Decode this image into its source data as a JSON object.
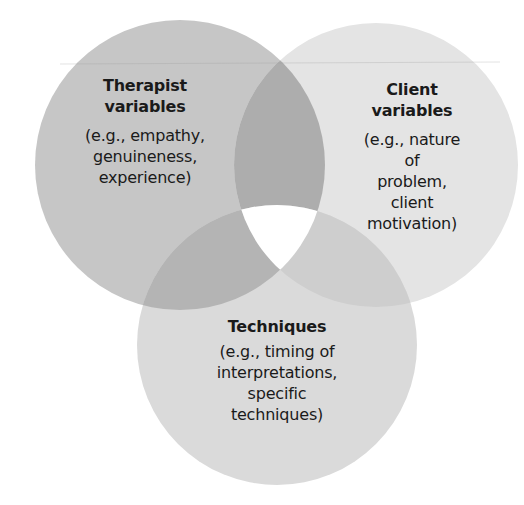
{
  "diagram": {
    "type": "venn",
    "background": "#ffffff",
    "sets": [
      {
        "id": "therapist",
        "title_line1": "Therapist",
        "title_line2": "variables",
        "desc_line1": "(e.g., empathy,",
        "desc_line2": "genuineness,",
        "desc_line3": "experience)",
        "fill": "#c6c6c6"
      },
      {
        "id": "client",
        "title_line1": "Client",
        "title_line2": "variables",
        "desc_line1": "(e.g., nature of",
        "desc_line2": "problem, client",
        "desc_line3": "motivation)",
        "fill": "#e4e4e4"
      },
      {
        "id": "techniques",
        "title_line1": "Techniques",
        "desc_line1": "(e.g., timing of",
        "desc_line2": "interpretations,",
        "desc_line3": "specific",
        "desc_line4": "techniques)",
        "fill": "#dadada"
      }
    ],
    "overlap_colors": {
      "therapist_client": "#adadad",
      "therapist_techniques": "#b4b4b4",
      "client_techniques": "#cecece",
      "all_three": "#ffffff"
    }
  }
}
